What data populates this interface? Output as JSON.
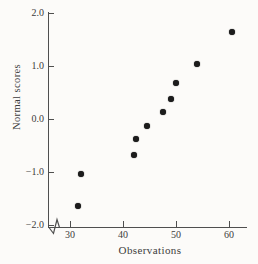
{
  "figure": {
    "background": "#fcfbf9",
    "ink": "#3c3c3c",
    "axis_color": "#4f4f4f",
    "dot_color": "#1c1c1c"
  },
  "chart_data": {
    "type": "scatter",
    "title": "",
    "xlabel": "Observations",
    "ylabel": "Normal scores",
    "x": [
      31.5,
      32,
      42,
      42.5,
      44.5,
      47.5,
      49,
      50,
      54,
      60.5
    ],
    "y": [
      -1.645,
      -1.036,
      -0.674,
      -0.385,
      -0.126,
      0.126,
      0.385,
      0.674,
      1.036,
      1.645
    ],
    "xlim": [
      25.8,
      63.5
    ],
    "ylim": [
      -2.0,
      2.0
    ],
    "x_ticks": [
      30,
      40,
      50,
      60
    ],
    "x_tick_labels": [
      "30",
      "40",
      "50",
      "60"
    ],
    "y_ticks": [
      2.0,
      1.0,
      0.0,
      -1.0,
      -2.0
    ],
    "y_tick_labels": [
      "2.0",
      "1.0",
      "0.0",
      "−1.0",
      "−2.0"
    ],
    "grid": false,
    "legend": null,
    "marker": "filled-circle",
    "axis_break_on_x": true
  }
}
